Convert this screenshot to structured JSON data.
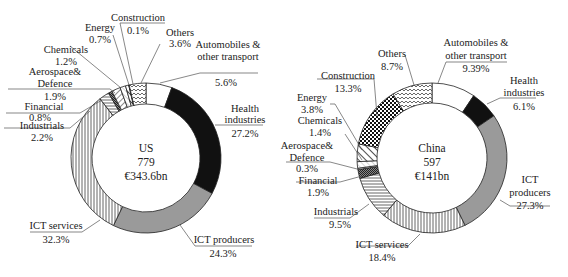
{
  "chart_data": [
    {
      "type": "pie",
      "subtype": "donut",
      "title": "US",
      "center_text": [
        "US",
        "779",
        "€343.6bn"
      ],
      "order": "clockwise from top",
      "categories": [
        "Automobiles & other transport",
        "Health industries",
        "ICT producers",
        "ICT services",
        "Industrials",
        "Financial",
        "Aerospace& Defence",
        "Chemicals",
        "Energy",
        "Construction",
        "Others"
      ],
      "values": [
        5.6,
        27.2,
        24.3,
        32.3,
        2.2,
        0.8,
        1.9,
        1.2,
        0.7,
        0.1,
        3.6
      ],
      "unit": "%"
    },
    {
      "type": "pie",
      "subtype": "donut",
      "title": "China",
      "center_text": [
        "China",
        "597",
        "€141bn"
      ],
      "order": "clockwise from top",
      "categories": [
        "Automobiles & other transport",
        "Health industries",
        "ICT producers",
        "ICT services",
        "Industrials",
        "Financial",
        "Aerospace& Defence",
        "Chemicals",
        "Energy",
        "Construction",
        "Others"
      ],
      "values": [
        9.39,
        6.1,
        27.3,
        18.4,
        9.5,
        1.9,
        0.3,
        1.4,
        3.8,
        13.3,
        8.7
      ],
      "unit": "%"
    }
  ],
  "patterns": {
    "Automobiles & other transport": "white",
    "Health industries": "black",
    "ICT producers": "grey",
    "ICT services": "vertical-lines",
    "Industrials": "horizontal-lines",
    "Financial": "dense-crosshatch",
    "Aerospace& Defence": "diagonal-lines",
    "Chemicals": "light-diagonal",
    "Energy": "wide-diagonal",
    "Construction": "checkerboard",
    "Others": "zigzag"
  },
  "us": {
    "center": [
      "US",
      "779",
      "€343.6bn"
    ],
    "labels": [
      {
        "lines": [
          "Automobiles &",
          "other transport",
          "5.6%"
        ]
      },
      {
        "lines": [
          "Health",
          "industries",
          "27.2%"
        ]
      },
      {
        "lines": [
          "ICT producers",
          "24.3%"
        ]
      },
      {
        "lines": [
          "ICT services",
          "32.3%"
        ]
      },
      {
        "lines": [
          "Industrials",
          "2.2%"
        ]
      },
      {
        "lines": [
          "Financial",
          "0.8%"
        ]
      },
      {
        "lines": [
          "Aerospace&",
          "Defence",
          "1.9%"
        ]
      },
      {
        "lines": [
          "Chemicals",
          "1.2%"
        ]
      },
      {
        "lines": [
          "Energy",
          "0.7%"
        ]
      },
      {
        "lines": [
          "Construction",
          "0.1%"
        ]
      },
      {
        "lines": [
          "Others",
          "3.6%"
        ]
      }
    ]
  },
  "china": {
    "center": [
      "China",
      "597",
      "€141bn"
    ],
    "labels": [
      {
        "lines": [
          "Automobiles &",
          "other transport",
          "9.39%"
        ]
      },
      {
        "lines": [
          "Health",
          "industries",
          "6.1%"
        ]
      },
      {
        "lines": [
          "ICT",
          "producers",
          "27.3%"
        ]
      },
      {
        "lines": [
          "ICT services",
          "18.4%"
        ]
      },
      {
        "lines": [
          "Industrials",
          "9.5%"
        ]
      },
      {
        "lines": [
          "Financial",
          "1.9%"
        ]
      },
      {
        "lines": [
          "Aerospace&",
          "Defence",
          "0.3%"
        ]
      },
      {
        "lines": [
          "Chemicals",
          "1.4%"
        ]
      },
      {
        "lines": [
          "Energy",
          "3.8%"
        ]
      },
      {
        "lines": [
          "Construction",
          "13.3%"
        ]
      },
      {
        "lines": [
          "Others",
          "8.7%"
        ]
      }
    ]
  }
}
